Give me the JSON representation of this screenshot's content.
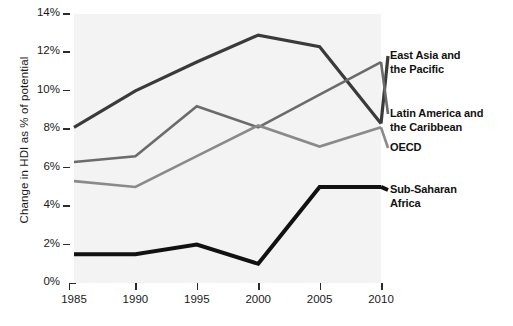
{
  "chart_data": {
    "type": "line",
    "title": "",
    "xlabel": "",
    "ylabel": "Change in HDI as % of potential",
    "x": [
      1985,
      1990,
      1995,
      2000,
      2005,
      2010
    ],
    "xtick_labels": [
      "1985",
      "1990",
      "1995",
      "2000",
      "2005",
      "2010"
    ],
    "ytick_labels": [
      "0%",
      "2%",
      "4%",
      "6%",
      "8%",
      "10%",
      "12%",
      "14%"
    ],
    "ytick_values": [
      0,
      2,
      4,
      6,
      8,
      10,
      12,
      14
    ],
    "ylim": [
      0,
      14
    ],
    "xlim": [
      1985,
      2010
    ],
    "grid": false,
    "legend_position": "right-inline",
    "series": [
      {
        "name": "East Asia and the Pacific",
        "label_lines": [
          "East Asia and",
          "the Pacific"
        ],
        "color": "#3a3a3a",
        "width": 3.2,
        "values": [
          8.1,
          10.0,
          11.5,
          12.9,
          12.3,
          8.3
        ]
      },
      {
        "name": "Latin America and the Caribbean",
        "label_lines": [
          "Latin America and",
          "the Caribbean"
        ],
        "color": "#6b6b6b",
        "width": 2.6,
        "values": [
          6.3,
          6.6,
          9.2,
          8.1,
          9.8,
          11.5
        ]
      },
      {
        "name": "OECD",
        "label_lines": [
          "OECD"
        ],
        "color": "#8a8a8a",
        "width": 2.6,
        "values": [
          5.3,
          5.0,
          6.6,
          8.2,
          7.1,
          8.1
        ]
      },
      {
        "name": "Sub-Saharan Africa",
        "label_lines": [
          "Sub-Saharan",
          "Africa"
        ],
        "color": "#111111",
        "width": 4.0,
        "values": [
          1.5,
          1.5,
          2.0,
          1.0,
          5.0,
          5.0
        ]
      }
    ],
    "plot_background": "#f3f3f3",
    "axis_color": "#2b2b2b",
    "text_color": "#1a1a1a"
  },
  "y_axis": {
    "title": "Change in HDI as % of potential",
    "ticks": [
      {
        "label": "0%",
        "value": 0
      },
      {
        "label": "2%",
        "value": 2
      },
      {
        "label": "4%",
        "value": 4
      },
      {
        "label": "6%",
        "value": 6
      },
      {
        "label": "8%",
        "value": 8
      },
      {
        "label": "10%",
        "value": 10
      },
      {
        "label": "12%",
        "value": 12
      },
      {
        "label": "14%",
        "value": 14
      }
    ]
  },
  "x_axis": {
    "ticks": [
      {
        "label": "1985"
      },
      {
        "label": "1990"
      },
      {
        "label": "1995"
      },
      {
        "label": "2000"
      },
      {
        "label": "2005"
      },
      {
        "label": "2010"
      }
    ]
  },
  "legend": {
    "items": [
      {
        "line1": "East Asia and",
        "line2": "the Pacific"
      },
      {
        "line1": "Latin America and",
        "line2": "the Caribbean"
      },
      {
        "line1": "OECD",
        "line2": ""
      },
      {
        "line1": "Sub-Saharan",
        "line2": "Africa"
      }
    ]
  }
}
